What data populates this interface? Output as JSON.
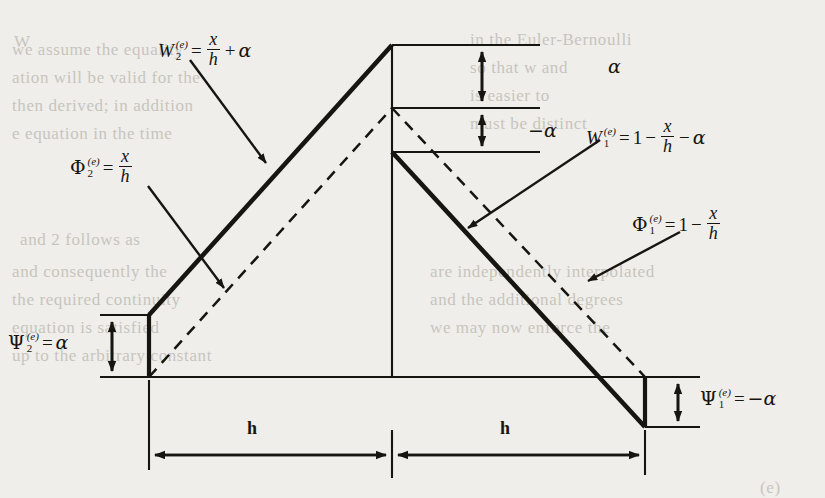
{
  "figure": {
    "background_color": "#efeeea",
    "ink_color": "#17150f"
  },
  "labels": {
    "w2": {
      "name": "W",
      "sup": "(e)",
      "sub": "2",
      "equals": "=",
      "numerator": "x",
      "denominator": "h",
      "operator": "+",
      "term": "α",
      "full_text": "W2(e) = x/h + α"
    },
    "w1": {
      "name": "W",
      "sup": "(e)",
      "sub": "1",
      "equals": "=",
      "one": "1",
      "minus1": "−",
      "numerator": "x",
      "denominator": "h",
      "minus2": "−",
      "term": "α",
      "full_text": "W1(e) = 1 − x/h − α"
    },
    "phi2": {
      "name": "Φ",
      "sup": "(e)",
      "sub": "2",
      "equals": "=",
      "numerator": "x",
      "denominator": "h",
      "full_text": "Φ2(e) = x/h"
    },
    "phi1": {
      "name": "Φ",
      "sup": "(e)",
      "sub": "1",
      "equals": "=",
      "one": "1",
      "minus": "−",
      "numerator": "x",
      "denominator": "h",
      "full_text": "Φ1(e) = 1 − x/h"
    },
    "psi2": {
      "name": "Ψ",
      "sup": "(e)",
      "sub": "2",
      "equals": "=",
      "value": "α",
      "full_text": "Ψ2(e) = α"
    },
    "psi1": {
      "name": "Ψ",
      "sup": "(e)",
      "sub": "1",
      "equals": "=",
      "value": "−α",
      "full_text": "Ψ1(e) = −α"
    },
    "alpha_positive": "α",
    "alpha_negative": "−α",
    "dim_left": "h",
    "dim_right": "h"
  },
  "bleed_text": [
    {
      "text": "W",
      "x": 14,
      "y": 32
    },
    {
      "text": "we assume the equality",
      "x": 12,
      "y": 40
    },
    {
      "text": "ation will be valid for the",
      "x": 12,
      "y": 68
    },
    {
      "text": "then derived; in addition",
      "x": 12,
      "y": 96
    },
    {
      "text": "e equation in the time",
      "x": 12,
      "y": 124
    },
    {
      "text": "and  2  follows as",
      "x": 20,
      "y": 230
    },
    {
      "text": "and  consequently  the",
      "x": 12,
      "y": 262
    },
    {
      "text": "the  required  continuity",
      "x": 12,
      "y": 290
    },
    {
      "text": "equation is satisfied",
      "x": 12,
      "y": 318
    },
    {
      "text": "up to the arbitrary constant",
      "x": 12,
      "y": 346
    },
    {
      "text": "in the Euler-Bernoulli",
      "x": 470,
      "y": 30
    },
    {
      "text": "so that w and",
      "x": 470,
      "y": 58
    },
    {
      "text": "is easier to",
      "x": 470,
      "y": 86
    },
    {
      "text": "must be distinct",
      "x": 470,
      "y": 114
    },
    {
      "text": "are independently interpolated",
      "x": 430,
      "y": 262
    },
    {
      "text": "and the additional degrees",
      "x": 430,
      "y": 290
    },
    {
      "text": "we may now enforce the",
      "x": 430,
      "y": 318
    },
    {
      "text": "(e)",
      "x": 760,
      "y": 478
    }
  ],
  "geometry": {
    "left_node_x": 149,
    "center_node_x": 392,
    "right_node_x": 645,
    "baseline_y": 377,
    "apex_top_y": 45,
    "apex_mid_y": 108,
    "apex_low_y": 152,
    "left_top_y": 315,
    "right_bottom_y": 427,
    "dimension_line_y": 455
  }
}
